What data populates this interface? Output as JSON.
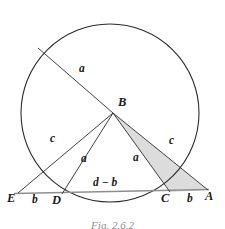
{
  "figure": {
    "caption": "Fig. 2.6.2",
    "colors": {
      "stroke": "#2b2b2b",
      "baseline_stroke": "#8f8f8f",
      "shaded_fill": "#dcdcdc",
      "background": "#ffffff",
      "label_color": "#1a1a1a",
      "caption_color": "#8c8c8c"
    },
    "points": [
      {
        "name": "E",
        "label": "E",
        "x": 12,
        "y": 199
      },
      {
        "name": "D",
        "label": "D",
        "x": 57,
        "y": 201
      },
      {
        "name": "C",
        "label": "C",
        "x": 166,
        "y": 199
      },
      {
        "name": "A",
        "label": "A",
        "x": 210,
        "y": 197
      },
      {
        "name": "B",
        "label": "B",
        "x": 122,
        "y": 104
      }
    ],
    "segment_labels": [
      {
        "name": "chord-upper-a",
        "label": "a",
        "x": 82,
        "y": 70
      },
      {
        "name": "left-c",
        "label": "c",
        "x": 53,
        "y": 140
      },
      {
        "name": "right-c",
        "label": "c",
        "x": 172,
        "y": 142
      },
      {
        "name": "left-interior-a",
        "label": "a",
        "x": 84,
        "y": 160
      },
      {
        "name": "right-interior-a",
        "label": "a",
        "x": 136,
        "y": 159
      },
      {
        "name": "segment-e-d-b",
        "label": "b",
        "x": 35,
        "y": 201
      },
      {
        "name": "segment-c-a-b",
        "label": "b",
        "x": 190,
        "y": 201
      },
      {
        "name": "segment-d-c",
        "label": "d − b",
        "x": 98,
        "y": 184
      }
    ]
  },
  "geometry": {
    "circle": {
      "cx": 110,
      "cy": 113,
      "r": 89
    },
    "baseline": {
      "x1": 14,
      "y1": 193,
      "x2": 209,
      "y2": 189
    },
    "vertex_b": {
      "x": 113,
      "y": 113
    },
    "point_d": {
      "x": 62,
      "y": 194
    },
    "point_c": {
      "x": 170,
      "y": 192
    },
    "point_e": {
      "x": 18,
      "y": 193
    },
    "point_a": {
      "x": 208,
      "y": 190
    },
    "chord_far_end": {
      "x": 38,
      "y": 48
    },
    "chord_right_end": {
      "x": 189,
      "y": 161
    },
    "shaded_triangle": "B-C-A"
  }
}
